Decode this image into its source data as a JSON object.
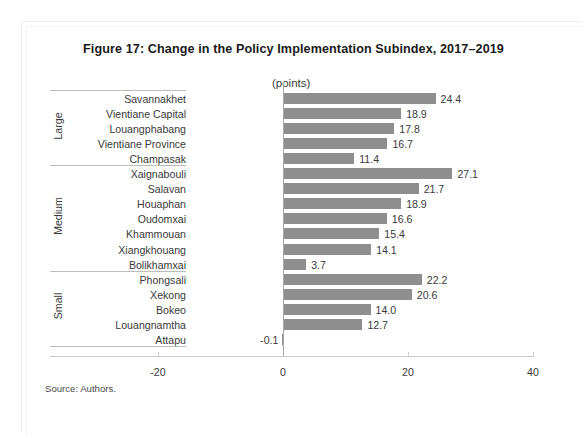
{
  "figure": {
    "title": "Figure 17: Change in the Policy Implementation Subindex, 2017–2019",
    "units_label": "(points)",
    "source_note": "Source: Authors."
  },
  "axis": {
    "ticks": [
      "-20",
      "0",
      "20",
      "40"
    ]
  },
  "groups": [
    {
      "name": "Large"
    },
    {
      "name": "Medium"
    },
    {
      "name": "Small"
    }
  ],
  "rows": [
    {
      "label": "Savannakhet",
      "value": "24.4",
      "group": "Large"
    },
    {
      "label": "Vientiane Capital",
      "value": "18.9",
      "group": "Large"
    },
    {
      "label": "Louangphabang",
      "value": "17.8",
      "group": "Large"
    },
    {
      "label": "Vientiane Province",
      "value": "16.7",
      "group": "Large"
    },
    {
      "label": "Champasak",
      "value": "11.4",
      "group": "Large"
    },
    {
      "label": "Xaignabouli",
      "value": "27.1",
      "group": "Medium"
    },
    {
      "label": "Salavan",
      "value": "21.7",
      "group": "Medium"
    },
    {
      "label": "Houaphan",
      "value": "18.9",
      "group": "Medium"
    },
    {
      "label": "Oudomxai",
      "value": "16.6",
      "group": "Medium"
    },
    {
      "label": "Khammouan",
      "value": "15.4",
      "group": "Medium"
    },
    {
      "label": "Xiangkhouang",
      "value": "14.1",
      "group": "Medium"
    },
    {
      "label": "Bolikhamxai",
      "value": "3.7",
      "group": "Medium"
    },
    {
      "label": "Phongsali",
      "value": "22.2",
      "group": "Small"
    },
    {
      "label": "Xekong",
      "value": "20.6",
      "group": "Small"
    },
    {
      "label": "Bokeo",
      "value": "14.0",
      "group": "Small"
    },
    {
      "label": "Louangnamtha",
      "value": "12.7",
      "group": "Small"
    },
    {
      "label": "Attapu",
      "value": "-0.1",
      "group": "Small"
    }
  ],
  "colors": {
    "bar": "#8e8e8e",
    "text": "#3a3a3a",
    "axis": "#c8c8c8"
  },
  "chart_data": {
    "type": "bar",
    "orientation": "horizontal",
    "title": "Figure 17: Change in the Policy Implementation Subindex, 2017–2019",
    "xlabel": "(points)",
    "ylabel": "",
    "xlim": [
      -20,
      40
    ],
    "xticks": [
      -20,
      0,
      20,
      40
    ],
    "grid": false,
    "legend": false,
    "categories": [
      "Savannakhet",
      "Vientiane Capital",
      "Louangphabang",
      "Vientiane Province",
      "Champasak",
      "Xaignabouli",
      "Salavan",
      "Houaphan",
      "Oudomxai",
      "Khammouan",
      "Xiangkhouang",
      "Bolikhamxai",
      "Phongsali",
      "Xekong",
      "Bokeo",
      "Louangnamtha",
      "Attapu"
    ],
    "values": [
      24.4,
      18.9,
      17.8,
      16.7,
      11.4,
      27.1,
      21.7,
      18.9,
      16.6,
      15.4,
      14.1,
      3.7,
      22.2,
      20.6,
      14.0,
      12.7,
      -0.1
    ],
    "group_bands": [
      {
        "name": "Large",
        "categories": [
          "Savannakhet",
          "Vientiane Capital",
          "Louangphabang",
          "Vientiane Province",
          "Champasak"
        ]
      },
      {
        "name": "Medium",
        "categories": [
          "Xaignabouli",
          "Salavan",
          "Houaphan",
          "Oudomxai",
          "Khammouan",
          "Xiangkhouang",
          "Bolikhamxai"
        ]
      },
      {
        "name": "Small",
        "categories": [
          "Phongsali",
          "Xekong",
          "Bokeo",
          "Louangnamtha",
          "Attapu"
        ]
      }
    ],
    "bar_color": "#8e8e8e",
    "source": "Source: Authors."
  }
}
